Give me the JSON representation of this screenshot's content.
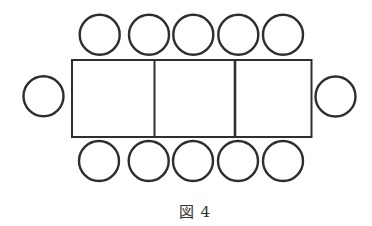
{
  "figure": {
    "caption": "図 4",
    "stroke_color": "#2e2e2e",
    "tables": {
      "count": 3,
      "outline": {
        "x": 72,
        "y": 60,
        "width": 239.5,
        "height": 77
      },
      "dividers_x": [
        154.5,
        235
      ]
    },
    "seats": {
      "radius": 20,
      "top_row": [
        {
          "cx": 99.7,
          "cy": 34.7
        },
        {
          "cx": 149,
          "cy": 34.7
        },
        {
          "cx": 193.3,
          "cy": 34.7
        },
        {
          "cx": 238.3,
          "cy": 34.7
        },
        {
          "cx": 283,
          "cy": 34.7
        }
      ],
      "bottom_row": [
        {
          "cx": 99,
          "cy": 161
        },
        {
          "cx": 148.7,
          "cy": 161
        },
        {
          "cx": 193,
          "cy": 161
        },
        {
          "cx": 238,
          "cy": 161
        },
        {
          "cx": 283,
          "cy": 161
        }
      ],
      "left_end": {
        "cx": 43.5,
        "cy": 96.3
      },
      "right_end": {
        "cx": 335.5,
        "cy": 96.5
      },
      "total": 12
    }
  }
}
